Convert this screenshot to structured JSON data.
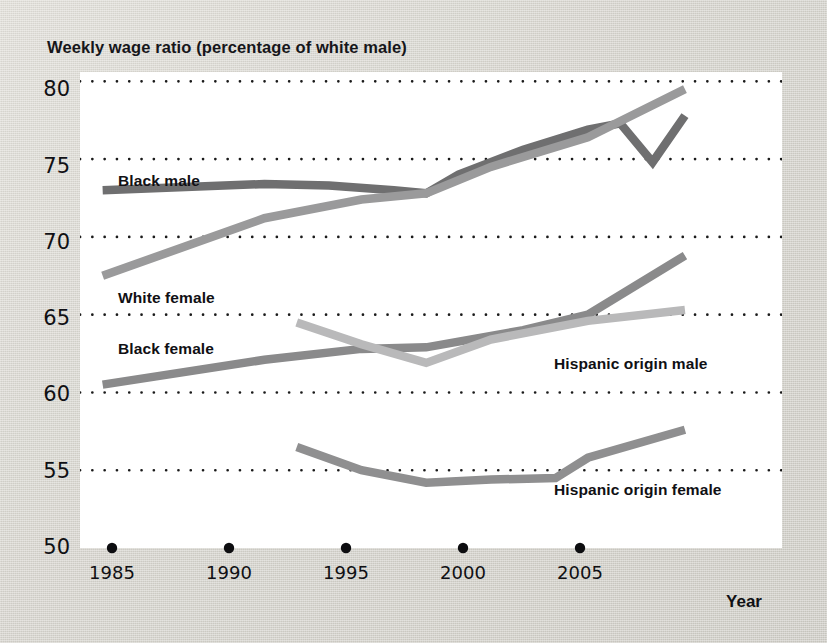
{
  "figure": {
    "title": "Weekly wage ratio (percentage of white male)",
    "xaxis_title": "Year",
    "y_ticks": [
      "80",
      "75",
      "70",
      "65",
      "60",
      "55",
      "50"
    ],
    "x_ticks": [
      "1985",
      "1990",
      "1995",
      "2000",
      "2005"
    ]
  },
  "labels": {
    "black_male": "Black male",
    "white_female": "White female",
    "black_female": "Black female",
    "hispanic_male": "Hispanic origin male",
    "hispanic_female": "Hispanic origin female"
  },
  "colors": {
    "black_male": "#6f6f70",
    "white_female": "#9a9a9b",
    "black_female": "#8a8a8b",
    "hispanic_male": "#b9b9ba",
    "hispanic_female": "#8f8f90",
    "plot_background": "#ffffff",
    "page_background": "#d4d2cb",
    "gridline": "#1a1a1a",
    "text": "#101014"
  },
  "chart_data": {
    "type": "line",
    "title": "Weekly wage ratio (percentage of white male)",
    "xlabel": "Year",
    "ylabel": "Weekly wage ratio (percentage of white male)",
    "xlim": [
      1984.3,
      2006.0
    ],
    "ylim": [
      50,
      80.6
    ],
    "yticks": [
      50,
      55,
      60,
      65,
      70,
      75,
      80
    ],
    "xticks": [
      1985,
      1990,
      1995,
      2000,
      2005
    ],
    "grid": "horizontal-dotted",
    "legend": "inline-annotations",
    "series": [
      {
        "name": "Black male",
        "color": "#6f6f70",
        "x": [
          1985,
          1990,
          1992,
          1994,
          1995,
          1996,
          1998,
          2000,
          2001,
          2002,
          2003
        ],
        "y": [
          73.0,
          73.4,
          73.3,
          73.0,
          72.8,
          74.0,
          75.6,
          76.9,
          77.3,
          74.8,
          77.8
        ]
      },
      {
        "name": "White female",
        "color": "#9a9a9b",
        "x": [
          1985,
          1990,
          1993,
          1995,
          1997,
          2000,
          2003
        ],
        "y": [
          67.5,
          71.2,
          72.4,
          72.8,
          74.5,
          76.4,
          79.5
        ]
      },
      {
        "name": "Black female",
        "color": "#8a8a8b",
        "x": [
          1985,
          1990,
          1993,
          1995,
          1998,
          2000,
          2003
        ],
        "y": [
          60.5,
          62.1,
          62.8,
          62.9,
          64.0,
          65.0,
          68.8
        ]
      },
      {
        "name": "Hispanic origin male",
        "color": "#b9b9ba",
        "x": [
          1991,
          1993,
          1995,
          1997,
          2000,
          2003
        ],
        "y": [
          64.5,
          63.1,
          61.9,
          63.4,
          64.6,
          65.3
        ]
      },
      {
        "name": "Hispanic origin female",
        "color": "#8f8f90",
        "x": [
          1991,
          1993,
          1995,
          1997,
          1999,
          2000,
          2003
        ],
        "y": [
          56.5,
          55.0,
          54.2,
          54.4,
          54.5,
          55.8,
          57.6
        ]
      }
    ]
  }
}
